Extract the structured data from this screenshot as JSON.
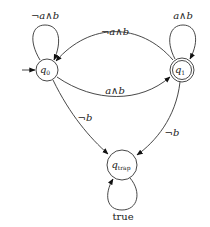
{
  "diagram": {
    "type": "automaton",
    "states": [
      {
        "id": "q0",
        "label": "q",
        "subscript": "0",
        "initial": true,
        "accepting": false
      },
      {
        "id": "q1",
        "label": "q",
        "subscript": "1",
        "initial": false,
        "accepting": true
      },
      {
        "id": "qtrap",
        "label": "q",
        "subscript": "trap",
        "initial": false,
        "accepting": false
      }
    ],
    "transitions": [
      {
        "from": "q0",
        "to": "q0",
        "label": "¬a∧b"
      },
      {
        "from": "q1",
        "to": "q1",
        "label": "a∧b"
      },
      {
        "from": "q1",
        "to": "q0",
        "label": "¬a∧b"
      },
      {
        "from": "q0",
        "to": "q1",
        "label": "a∧b"
      },
      {
        "from": "q0",
        "to": "qtrap",
        "label": "¬b"
      },
      {
        "from": "q1",
        "to": "qtrap",
        "label": "¬b"
      },
      {
        "from": "qtrap",
        "to": "qtrap",
        "label": "true"
      }
    ]
  }
}
